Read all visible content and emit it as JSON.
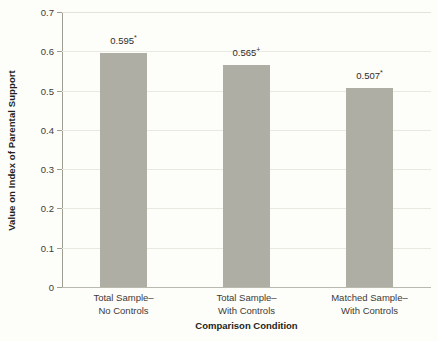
{
  "chart_data": {
    "type": "bar",
    "title": "",
    "xlabel": "Comparison Condition",
    "ylabel": "Value on Index of Parental Support",
    "categories": [
      "Total Sample–\nNo Controls",
      "Total Sample–\nWith Controls",
      "Matched Sample–\nWith Controls"
    ],
    "category_lines": [
      [
        "Total Sample–",
        "No Controls"
      ],
      [
        "Total Sample–",
        "With Controls"
      ],
      [
        "Matched Sample–",
        "With Controls"
      ]
    ],
    "values": [
      0.595,
      0.565,
      0.507
    ],
    "data_labels": [
      "0.595",
      "0.565",
      "0.507"
    ],
    "significance_marks": [
      "*",
      "+",
      "*"
    ],
    "ylim": [
      0,
      0.7
    ],
    "ytick_values": [
      0,
      0.1,
      0.2,
      0.3,
      0.4,
      0.5,
      0.6,
      0.7
    ],
    "ytick_labels": [
      "0",
      "0.1",
      "0.2",
      "0.3",
      "0.4",
      "0.5",
      "0.6",
      "0.7"
    ],
    "grid": true,
    "legend": "none",
    "bar_color": "#aeaea4",
    "grid_color": "#e9e9e2",
    "axis_color": "#9d9d92",
    "background_color": "#fdfdfa",
    "text_color": "#231f20"
  }
}
